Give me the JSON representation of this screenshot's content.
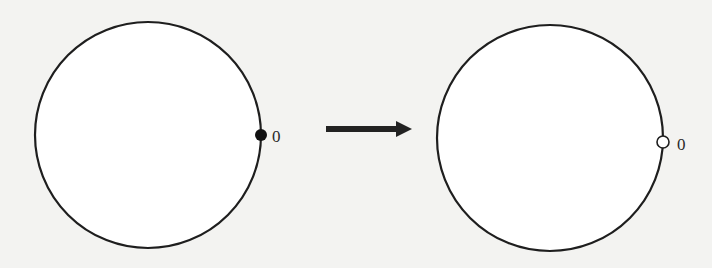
{
  "diagram": {
    "type": "state-transition",
    "left_panel": {
      "shape": "circle",
      "marker": {
        "style": "filled",
        "label": "0"
      }
    },
    "transition": {
      "style": "arrow",
      "direction": "right"
    },
    "right_panel": {
      "shape": "circle",
      "marker": {
        "style": "open",
        "label": "0"
      }
    },
    "colors": {
      "stroke": "#1e1e1e",
      "background": "#f3f3f1",
      "open_fill": "#ffffff"
    }
  }
}
